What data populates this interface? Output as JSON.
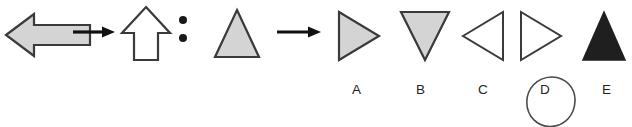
{
  "puzzle": {
    "type": "visual-analogy-matrix",
    "canvas": {
      "width": 632,
      "height": 127,
      "background": "#ffffff"
    },
    "colors": {
      "fill_gray": "#d4d4d4",
      "fill_white": "#ffffff",
      "fill_black": "#1f1f1f",
      "stroke_dark": "#3a3a3a",
      "ink": "#231f20",
      "circle_marker": "#4a4a4a"
    },
    "prompt_row": {
      "items": [
        {
          "id": "prompt-1",
          "icon_name": "left-block-arrow",
          "label": "gray left arrow",
          "fill": "gray",
          "direction": "left"
        },
        {
          "id": "prompt-connector-1",
          "icon_name": "right-arrow-connector",
          "label": "maps to"
        },
        {
          "id": "prompt-2",
          "icon_name": "up-block-arrow",
          "label": "white up arrow",
          "fill": "white",
          "direction": "up"
        },
        {
          "id": "prompt-colon",
          "icon_name": "colon-separator",
          "label": ":"
        },
        {
          "id": "prompt-3",
          "icon_name": "up-triangle",
          "label": "gray up triangle",
          "fill": "gray",
          "direction": "up"
        },
        {
          "id": "prompt-connector-2",
          "icon_name": "right-arrow-connector",
          "label": "maps to"
        },
        {
          "id": "prompt-4",
          "icon_name": "question-slot",
          "label": "?"
        }
      ]
    },
    "options": [
      {
        "key": "A",
        "icon_name": "right-triangle",
        "fill": "gray",
        "direction": "right",
        "selected": false
      },
      {
        "key": "B",
        "icon_name": "down-triangle",
        "fill": "gray",
        "direction": "down",
        "selected": false
      },
      {
        "key": "C",
        "icon_name": "left-triangle",
        "fill": "white",
        "direction": "left",
        "selected": false
      },
      {
        "key": "D",
        "icon_name": "right-triangle",
        "fill": "white",
        "direction": "right",
        "selected": true
      },
      {
        "key": "E",
        "icon_name": "up-triangle",
        "fill": "black",
        "direction": "up",
        "selected": false
      }
    ],
    "selection": {
      "key": "D",
      "marker": "hand-drawn-circle"
    }
  }
}
